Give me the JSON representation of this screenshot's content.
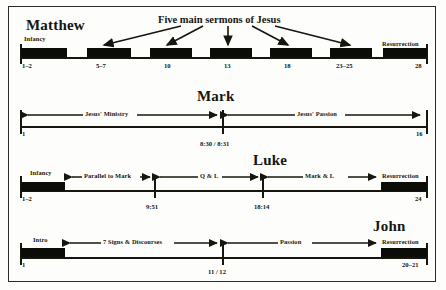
{
  "figure": {
    "callout": "Five main sermons of Jesus"
  },
  "gospels": [
    {
      "id": "matthew",
      "title": "Matthew",
      "start_label": "1–2",
      "end_label": "28",
      "segments": [
        {
          "label": "Infancy"
        },
        {
          "label": "Resurrection"
        }
      ],
      "sermon_labels": [
        "5–7",
        "10",
        "13",
        "18",
        "23–25"
      ]
    },
    {
      "id": "mark",
      "title": "Mark",
      "start_label": "1",
      "end_label": "16",
      "mid_label": "8:30 / 8:31",
      "segments": [
        {
          "label": "Jesus' Ministry"
        },
        {
          "label": "Jesus' Passion"
        }
      ]
    },
    {
      "id": "luke",
      "title": "Luke",
      "start_label": "1–2",
      "end_label": "24",
      "tick_labels": [
        "9:51",
        "18:14"
      ],
      "segments": [
        {
          "label": "Infancy"
        },
        {
          "label": "Parallel to Mark"
        },
        {
          "label": "Q & L"
        },
        {
          "label": "Mark & L"
        },
        {
          "label": "Resurrection"
        }
      ]
    },
    {
      "id": "john",
      "title": "John",
      "start_label": "1",
      "end_label": "20–21",
      "mid_label": "11 / 12",
      "segments": [
        {
          "label": "Intro"
        },
        {
          "label": "7 Signs & Discourses"
        },
        {
          "label": "Passion"
        },
        {
          "label": "Resurrection"
        }
      ]
    }
  ]
}
